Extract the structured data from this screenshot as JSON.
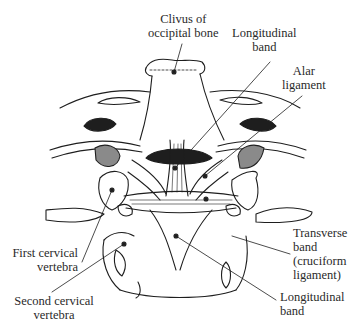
{
  "figure": {
    "labels": {
      "clivus": {
        "line1": "Clivus of",
        "line2": "occipital bone"
      },
      "longitudinal_band_top": {
        "line1": "Longitudinal",
        "line2": "band"
      },
      "alar_ligament": {
        "line1": "Alar",
        "line2": "ligament"
      },
      "first_cervical": {
        "line1": "First cervical",
        "line2": "vertebra"
      },
      "second_cervical": {
        "line1": "Second cervical",
        "line2": "vertebra"
      },
      "transverse_band": {
        "line1": "Transverse",
        "line2": "band",
        "line3": "(cruciform",
        "line4": "ligament)"
      },
      "longitudinal_band_bottom": {
        "line1": "Longitudinal",
        "line2": "band"
      }
    },
    "colors": {
      "ink": "#1e1e1e",
      "shade": "#8a8a8a",
      "background": "#ffffff"
    }
  }
}
